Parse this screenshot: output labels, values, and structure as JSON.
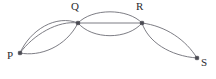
{
  "figure": {
    "type": "multigraph-diagram",
    "width": 216,
    "height": 79,
    "background_color": "#ffffff",
    "edge_color": "#6e6e76",
    "vertex_color": "#4a4a52",
    "label_color": "#2b2b2f"
  },
  "vertices": [
    {
      "id": "P",
      "label": "P",
      "x": 20,
      "y": 53,
      "label_x": 7,
      "label_y": 50
    },
    {
      "id": "Q",
      "label": "Q",
      "x": 78,
      "y": 23,
      "label_x": 71,
      "label_y": 1
    },
    {
      "id": "R",
      "label": "R",
      "x": 142,
      "y": 23,
      "label_x": 136,
      "label_y": 1
    },
    {
      "id": "S",
      "label": "S",
      "x": 197,
      "y": 58,
      "label_x": 201,
      "label_y": 57
    }
  ],
  "edges": [
    {
      "id": "pq-1",
      "from": "P",
      "to": "Q",
      "style": "arc-upper-outer",
      "path": "M 20 53 C 30 30 56 14 78 23"
    },
    {
      "id": "pq-2",
      "from": "P",
      "to": "Q",
      "style": "arc-upper-inner",
      "path": "M 20 53 C 33 35 58 20 78 23"
    },
    {
      "id": "pq-3",
      "from": "P",
      "to": "Q",
      "style": "arc-lower",
      "path": "M 20 53 C 40 57 66 47 78 23"
    },
    {
      "id": "qr-1",
      "from": "Q",
      "to": "R",
      "style": "arc-upper",
      "path": "M 78 23 C 92 8 128 8 142 23"
    },
    {
      "id": "qr-2",
      "from": "Q",
      "to": "R",
      "style": "straight",
      "path": "M 78 23 L 142 23"
    },
    {
      "id": "qr-3",
      "from": "Q",
      "to": "R",
      "style": "arc-lower",
      "path": "M 78 23 C 92 40 128 40 142 23"
    },
    {
      "id": "rs-1",
      "from": "R",
      "to": "S",
      "style": "arc-right",
      "path": "M 142 23 C 166 26 186 40 197 58"
    },
    {
      "id": "rs-2",
      "from": "R",
      "to": "S",
      "style": "arc-left",
      "path": "M 142 23 C 148 42 170 56 197 58"
    }
  ],
  "edge_multiplicity": {
    "P-Q": 3,
    "Q-R": 3,
    "R-S": 2
  }
}
